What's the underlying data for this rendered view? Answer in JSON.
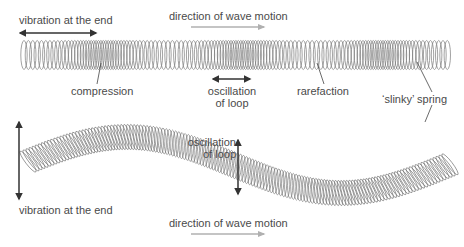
{
  "diagram": {
    "type": "longitudinal vs transverse waves on a slinky spring",
    "top": {
      "labels": {
        "vibration": "vibration at the end",
        "direction": "direction of wave motion",
        "compression": "compression",
        "oscillation_line1": "oscillation",
        "oscillation_line2": "of loop",
        "rarefaction": "rarefaction",
        "slinky": "‘slinky’ spring"
      }
    },
    "bottom": {
      "labels": {
        "oscillation_line1": "oscillation",
        "oscillation_line2": "of loop",
        "vibration": "vibration at the end",
        "direction": "direction of wave motion"
      }
    },
    "colors": {
      "arrow_dark": "#333333",
      "arrow_light": "#b0b0b0",
      "coil": "#7a7a7a",
      "text": "#4a4a4a"
    }
  }
}
